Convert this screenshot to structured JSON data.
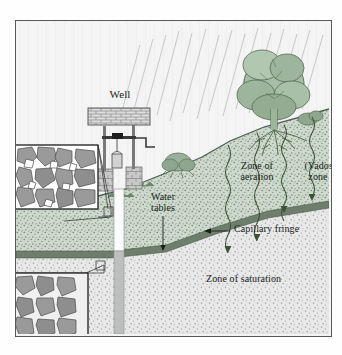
{
  "figure": {
    "domain": "diagram",
    "type": "geological-cross-section"
  },
  "labels": {
    "well": "Well",
    "zone_of_aeration": "Zone of\naeration",
    "vadose_zone": "(Vadose\nzone)",
    "water_tables": "Water\ntables",
    "capillary_fringe": "Capillary fringe",
    "zone_of_saturation": "Zone of saturation"
  },
  "label_lines": {
    "zone_of_aeration_line1": "Zone of",
    "zone_of_aeration_line2": "aeration",
    "vadose_zone_line1": "(Vadose",
    "vadose_zone_line2": "zone )",
    "water_tables_line1": "Water",
    "water_tables_line2": "tables"
  },
  "zones": [
    {
      "name": "sky",
      "description": "pale sky with diagonal rain streaks",
      "color": "#f2f3f2"
    },
    {
      "name": "zone-of-aeration",
      "description": "unsaturated stippled soil above the water table",
      "color": "#ccd9cc"
    },
    {
      "name": "capillary-fringe",
      "description": "dark green band marking the water table",
      "color": "#6d7f6b"
    },
    {
      "name": "zone-of-saturation",
      "description": "saturated light grey stippled rock below the water table",
      "color": "#e6e7e6"
    }
  ],
  "insets": [
    {
      "name": "unsaturated-rock-inset",
      "caption": "",
      "description": "angular rock grains with white air-filled pore spaces"
    },
    {
      "name": "saturated-rock-inset",
      "caption": "",
      "description": "angular rock grains with grey water-filled pore spaces"
    }
  ],
  "features": {
    "tree": "deciduous tree with root system",
    "shrub": "small shrub on slope",
    "rain": "diagonal rainfall streaks",
    "infiltration_arrows": 4,
    "well_shaft": "vertical well shaft, dry above water table and water filled below",
    "well_structure": "brick roof, posts, winch crossbar, bucket on rope, crank handle, two stone piers"
  },
  "colors": {
    "frame_border": "#55595c",
    "ink": "#1b1b1b",
    "vegetation": "#6f8570",
    "soil_green": "#ccd9cc",
    "fringe": "#6d7f6b",
    "saturated": "#e6e7e6",
    "rock_fill": "#9a9a9a",
    "page_background": "#ffffff"
  }
}
